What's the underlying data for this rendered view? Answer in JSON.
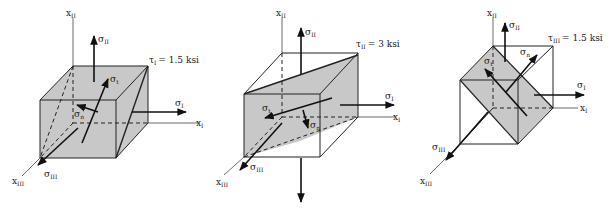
{
  "figures": [
    {
      "id": "left",
      "shear": {
        "label": "τ",
        "sub": "I",
        "value": "= 1.5 ksi"
      },
      "axes": {
        "x1": {
          "label": "x",
          "sub": "I"
        },
        "x2": {
          "label": "x",
          "sub": "II"
        },
        "x3": {
          "label": "x",
          "sub": "III"
        }
      },
      "stresses": {
        "s1": {
          "label": "σ",
          "sub": "I"
        },
        "s2": {
          "label": "σ",
          "sub": "II"
        },
        "s3": {
          "label": "σ",
          "sub": "III"
        },
        "st": {
          "label": "σ",
          "sub": "t"
        },
        "sn": {
          "label": "σ",
          "sub": "n"
        }
      }
    },
    {
      "id": "middle",
      "shear": {
        "label": "τ",
        "sub": "II",
        "value": "= 3 ksi"
      },
      "axes": {
        "x1": {
          "label": "x",
          "sub": "I"
        },
        "x2": {
          "label": "x",
          "sub": "II"
        },
        "x3": {
          "label": "x",
          "sub": "III"
        }
      },
      "stresses": {
        "s1": {
          "label": "σ",
          "sub": "I"
        },
        "s2": {
          "label": "σ",
          "sub": "II"
        },
        "s3": {
          "label": "σ",
          "sub": "III"
        },
        "st": {
          "label": "σ",
          "sub": "t"
        },
        "sn": {
          "label": "σ",
          "sub": "n"
        }
      }
    },
    {
      "id": "right",
      "shear": {
        "label": "τ",
        "sub": "III",
        "value": "= 1.5 ksi"
      },
      "axes": {
        "x1": {
          "label": "x",
          "sub": "I"
        },
        "x2": {
          "label": "x",
          "sub": "II"
        },
        "x3": {
          "label": "x",
          "sub": "III"
        }
      },
      "stresses": {
        "s1": {
          "label": "σ",
          "sub": "I"
        },
        "s2": {
          "label": "σ",
          "sub": "II"
        },
        "s3": {
          "label": "σ",
          "sub": "III"
        },
        "st": {
          "label": "σ",
          "sub": "t"
        },
        "sn": {
          "label": "σ",
          "sub": "n"
        }
      }
    }
  ],
  "colors": {
    "face": "#c8c8c8",
    "line": "#222222"
  }
}
